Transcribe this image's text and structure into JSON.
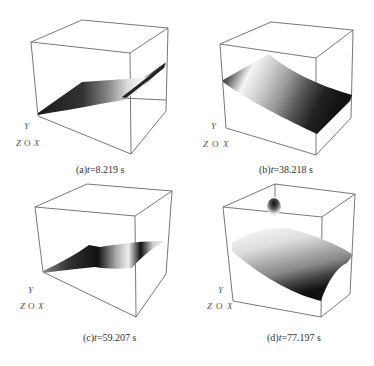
{
  "figure": {
    "panels": [
      {
        "id": "a",
        "label": "(a)",
        "var": "t",
        "eq": "=8.219 s",
        "caption": "(a)t=8.219 s"
      },
      {
        "id": "b",
        "label": "(b)",
        "var": "t",
        "eq": "=38.218 s",
        "caption": "(b)t=38.218 s"
      },
      {
        "id": "c",
        "label": "(c)",
        "var": "t",
        "eq": "=59.207 s",
        "caption": "(c)t=59.207 s"
      },
      {
        "id": "d",
        "label": "(d)",
        "var": "t",
        "eq": "=77.197 s",
        "caption": "(d)t=77.197 s"
      }
    ],
    "axes": {
      "y": "Y",
      "z": "Z",
      "o": "O",
      "x": "X"
    },
    "colors": {
      "edge": "#555555",
      "surface_dark": "#1a1a1a",
      "surface_light": "#f2f2f2"
    }
  }
}
